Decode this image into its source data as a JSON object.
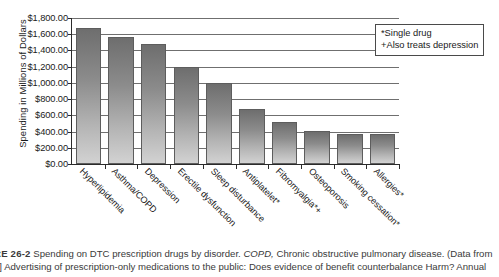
{
  "chart_data": {
    "type": "bar",
    "title": "",
    "xlabel": "",
    "ylabel": "Spending in Millions of Dollars",
    "ylim": [
      0,
      1800
    ],
    "ytick_step": 200,
    "grid": true,
    "legend_position": "top-right",
    "categories": [
      "Hyperlipidemia",
      "Asthma/COPD",
      "Depression",
      "Erectile dysfunction",
      "Sleep disturbance",
      "Antiplatelet*",
      "Fibromyalgia*+",
      "Osteoporosis",
      "Smoking cessation*",
      "Allergies*"
    ],
    "values": [
      1675,
      1560,
      1480,
      1190,
      1000,
      680,
      520,
      410,
      375,
      370
    ],
    "ytick_labels": [
      "$1,800.00",
      "$1,600.00",
      "$1,400.00",
      "$1,200.00",
      "$1,000.00",
      "$800.00",
      "$600.00",
      "$400.00",
      "$200.00",
      "$0.00"
    ],
    "ytick_values": [
      1800,
      1600,
      1400,
      1200,
      1000,
      800,
      600,
      400,
      200,
      0
    ],
    "annotations": [
      "*Single drug",
      "+Also treats depression"
    ]
  },
  "legend": {
    "line1": "*Single drug",
    "line2": "+Also treats depression"
  },
  "caption": {
    "figure_number": "RE 26-2",
    "line1_main": "Spending on DTC prescription drugs by disorder.",
    "line1_italic": "COPD,",
    "line1_tail": "Chronic obstructive pulmonary  disease. (Data from",
    "line2": "2] Advertising of prescription-only medications to the public: Does evidence of benefit counterbalance Harm? Annual"
  }
}
